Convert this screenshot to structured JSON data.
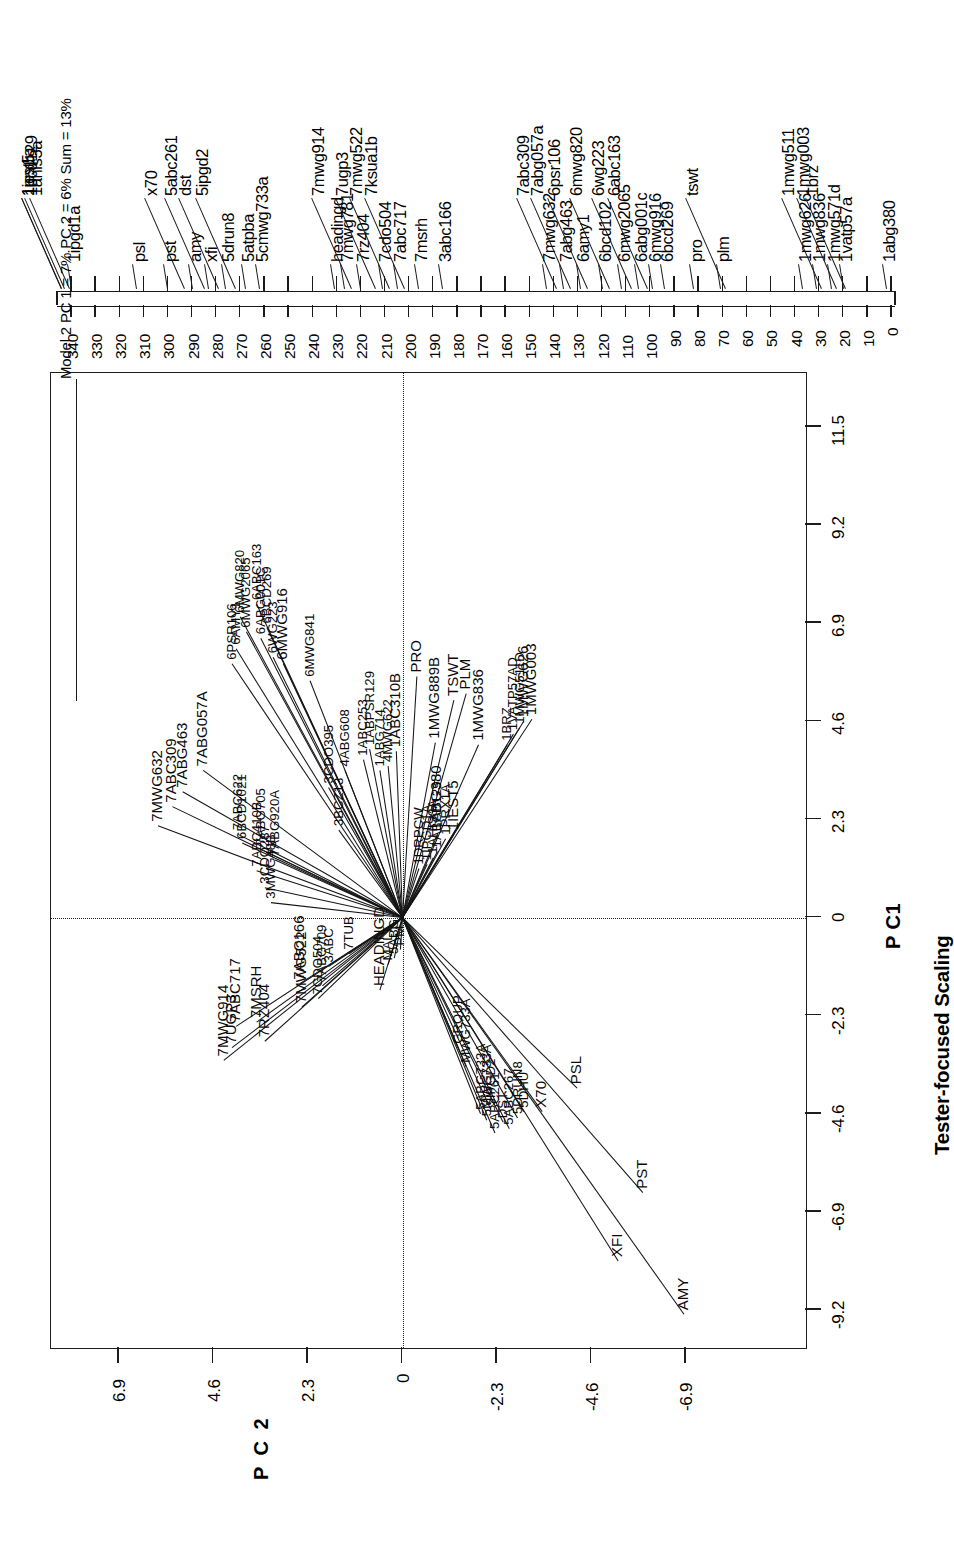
{
  "figure": {
    "domain": "chart",
    "title_box": "Model 2 PC 1 = 7% PC 2 = 6% Sum = 13%",
    "subtitle": "Tester-focused Scaling",
    "pc1_label": "P C1",
    "pc2_label": "P C 2"
  },
  "chart_data": {
    "type": "scatter",
    "title": "Model 2 PC 1 = 7% PC 2 = 6% Sum = 13%",
    "subtitle": "Tester-focused Scaling",
    "xlabel": "P C1",
    "ylabel": "P C 2",
    "xlim": [
      -10.35,
      12.65
    ],
    "ylim": [
      -8.05,
      8.05
    ],
    "xticks": [
      -9.2,
      -6.9,
      -4.6,
      -2.3,
      0,
      2.3,
      4.6,
      6.9,
      9.2,
      11.5
    ],
    "xticklabels": [
      "-9.2",
      "-6.9",
      "-4.6",
      "-2.3",
      "0",
      "2.3",
      "4.6",
      "6.9",
      "9.2",
      "11.5"
    ],
    "yticks": [
      6.9,
      4.6,
      2.3,
      0,
      -2.3,
      -4.6,
      -6.9
    ],
    "yticklabels": [
      "6.9",
      "4.6",
      "2.3",
      "0",
      "-2.3",
      "-4.6",
      "-6.9"
    ],
    "grid": false,
    "legend": "none",
    "origin": [
      0,
      0
    ],
    "reference_lines": [
      {
        "orientation": "vertical",
        "value": 0,
        "style": "dashed"
      },
      {
        "orientation": "horizontal",
        "value": 0,
        "style": "dashed"
      }
    ],
    "vectors": [
      {
        "label": "AMY",
        "x": -9.3,
        "y": -6.85
      },
      {
        "label": "XFI",
        "x": -8.05,
        "y": -5.25
      },
      {
        "label": "PST",
        "x": -6.45,
        "y": -5.85
      },
      {
        "label": "X70",
        "x": -4.55,
        "y": -3.4
      },
      {
        "label": "PSL",
        "x": -4.0,
        "y": -4.25
      },
      {
        "label": "5ABC261",
        "x": -5.05,
        "y": -2.25
      },
      {
        "label": "5ABC267",
        "x": -4.95,
        "y": -2.6
      },
      {
        "label": "DST",
        "x": -4.8,
        "y": -2.45
      },
      {
        "label": "5DRUN8",
        "x": -4.7,
        "y": -2.8
      },
      {
        "label": "5DHU",
        "x": -4.55,
        "y": -2.95
      },
      {
        "label": "5IPGD2",
        "x": -4.5,
        "y": -2.15
      },
      {
        "label": "5MWG733A",
        "x": -4.75,
        "y": -2.05
      },
      {
        "label": "5ABG733A",
        "x": -4.6,
        "y": -1.9
      },
      {
        "label": "MWG733A",
        "x": -3.5,
        "y": -1.55
      },
      {
        "label": "GROUP",
        "x": -3.05,
        "y": -1.35
      },
      {
        "label": "7MWG914",
        "x": -3.35,
        "y": 4.35
      },
      {
        "label": "7UGP3",
        "x": -3.05,
        "y": 4.15
      },
      {
        "label": "7ABC717",
        "x": -2.55,
        "y": 4.05
      },
      {
        "label": "7MSRH",
        "x": -2.45,
        "y": 3.55
      },
      {
        "label": "7RZ404",
        "x": -2.9,
        "y": 3.35
      },
      {
        "label": "7MWG522",
        "x": -2.1,
        "y": 2.45
      },
      {
        "label": "7ABC166",
        "x": -1.55,
        "y": 2.5
      },
      {
        "label": "7CDO504",
        "x": -1.9,
        "y": 2.05
      },
      {
        "label": "7ABG709",
        "x": -1.6,
        "y": 1.95
      },
      {
        "label": "3ABC",
        "x": -1.15,
        "y": 1.8
      },
      {
        "label": "HEADINGD",
        "x": -1.7,
        "y": 0.55
      },
      {
        "label": "7TUB",
        "x": -0.85,
        "y": 1.3
      },
      {
        "label": "MALT",
        "x": -1.1,
        "y": 0.35
      },
      {
        "label": "PM",
        "x": -0.75,
        "y": 0.05
      },
      {
        "label": "5ABG",
        "x": -0.95,
        "y": 0.2
      },
      {
        "label": "7MWG632",
        "x": 2.15,
        "y": 5.95
      },
      {
        "label": "7ABC309",
        "x": 2.6,
        "y": 5.6
      },
      {
        "label": "7ABG463",
        "x": 2.95,
        "y": 5.35
      },
      {
        "label": "7ABG057A",
        "x": 3.45,
        "y": 4.85
      },
      {
        "label": "7ABC622",
        "x": 1.95,
        "y": 4.0
      },
      {
        "label": "7ABG705",
        "x": 1.6,
        "y": 3.45
      },
      {
        "label": "7ABC410B",
        "x": 1.1,
        "y": 3.55
      },
      {
        "label": "7ABG920A",
        "x": 1.35,
        "y": 3.1
      },
      {
        "label": "3CDO287",
        "x": 0.7,
        "y": 3.35
      },
      {
        "label": "3MWG48B",
        "x": 0.35,
        "y": 3.2
      },
      {
        "label": "6PSR106",
        "x": 5.95,
        "y": 4.15
      },
      {
        "label": "6AMY1",
        "x": 6.3,
        "y": 4.05
      },
      {
        "label": "6MWG820",
        "x": 7.05,
        "y": 3.95
      },
      {
        "label": "6MWG2065",
        "x": 6.7,
        "y": 3.8
      },
      {
        "label": "6ABC163",
        "x": 7.35,
        "y": 3.55
      },
      {
        "label": "6ABG001C",
        "x": 6.55,
        "y": 3.45
      },
      {
        "label": "6BCD269",
        "x": 6.8,
        "y": 3.3
      },
      {
        "label": "6MWG916",
        "x": 5.95,
        "y": 2.9
      },
      {
        "label": "6WG223",
        "x": 6.1,
        "y": 3.15
      },
      {
        "label": "6MWG841",
        "x": 5.55,
        "y": 2.25
      },
      {
        "label": "6BCD1021",
        "x": 1.75,
        "y": 3.9
      },
      {
        "label": "3CDO395",
        "x": 3.05,
        "y": 1.8
      },
      {
        "label": "3BCZ13",
        "x": 2.05,
        "y": 1.55
      },
      {
        "label": "4ABG608",
        "x": 3.45,
        "y": 1.4
      },
      {
        "label": "1ABC253",
        "x": 3.7,
        "y": 0.95
      },
      {
        "label": "1ABPSR129",
        "x": 3.95,
        "y": 0.8
      },
      {
        "label": "1ABG714",
        "x": 3.45,
        "y": 0.55
      },
      {
        "label": "4MWG622",
        "x": 3.55,
        "y": 0.35
      },
      {
        "label": "1ABC310B",
        "x": 3.9,
        "y": 0.15
      },
      {
        "label": "1MWG889B",
        "x": 4.1,
        "y": -0.8
      },
      {
        "label": "1MWG836",
        "x": 4.05,
        "y": -1.85
      },
      {
        "label": "1BRZ",
        "x": 4.05,
        "y": -2.55
      },
      {
        "label": "1VATP57AD",
        "x": 4.3,
        "y": -2.7
      },
      {
        "label": "1MWG511D",
        "x": 4.45,
        "y": -2.85
      },
      {
        "label": "1MWG626",
        "x": 4.6,
        "y": -2.95
      },
      {
        "label": "1MWG003",
        "x": 4.65,
        "y": -3.15
      },
      {
        "label": "PRO",
        "x": 5.65,
        "y": -0.35
      },
      {
        "label": "TSWT",
        "x": 5.1,
        "y": -1.25
      },
      {
        "label": "PLM",
        "x": 5.25,
        "y": -1.55
      },
      {
        "label": "1DRPCW",
        "x": 1.15,
        "y": -0.4
      },
      {
        "label": "1IPGD1A",
        "x": 1.25,
        "y": -0.6
      },
      {
        "label": "1AHIS3A",
        "x": 1.4,
        "y": -0.75
      },
      {
        "label": "1ABCD129",
        "x": 1.55,
        "y": -0.85
      },
      {
        "label": "1ABG380",
        "x": 1.95,
        "y": -0.85
      },
      {
        "label": "1PRX1A",
        "x": 1.85,
        "y": -1.05
      },
      {
        "label": "1IEST5",
        "x": 1.95,
        "y": -1.25
      }
    ]
  },
  "map_axis": {
    "range_cM": [
      0,
      340
    ],
    "tick_major_step": 10,
    "tick_labels": [
      "340",
      "330",
      "320",
      "310",
      "300",
      "290",
      "280",
      "270",
      "260",
      "250",
      "240",
      "230",
      "220",
      "210",
      "200",
      "190",
      "180",
      "170",
      "160",
      "150",
      "140",
      "130",
      "120",
      "110",
      "100",
      "90",
      "80",
      "70",
      "60",
      "50",
      "40",
      "30",
      "20",
      "10",
      "0"
    ],
    "markers": [
      {
        "name": "1prx1a",
        "cM": 344,
        "row": 6
      },
      {
        "name": "1iest5",
        "cM": 344,
        "row": 7
      },
      {
        "name": "1bcd129",
        "cM": 343,
        "row": 5
      },
      {
        "name": "1ahis3a",
        "cM": 341,
        "row": 7
      },
      {
        "name": "1ipgd1a",
        "cM": 340,
        "row": 4
      },
      {
        "name": "psl",
        "cM": 313,
        "row": 2
      },
      {
        "name": "pst",
        "cM": 300,
        "row": 2
      },
      {
        "name": "x70",
        "cM": 293,
        "row": 5
      },
      {
        "name": "amy",
        "cM": 290,
        "row": 2
      },
      {
        "name": "5abc261",
        "cM": 285,
        "row": 6
      },
      {
        "name": "xfi",
        "cM": 283,
        "row": 2
      },
      {
        "name": "dst",
        "cM": 279,
        "row": 5
      },
      {
        "name": "5drun8",
        "cM": 276,
        "row": 3
      },
      {
        "name": "5ipgd2",
        "cM": 272,
        "row": 5
      },
      {
        "name": "5atpba",
        "cM": 268,
        "row": 3
      },
      {
        "name": "5cmwg733a",
        "cM": 262,
        "row": 3
      },
      {
        "name": "headingd",
        "cM": 231,
        "row": 2
      },
      {
        "name": "7mwg781",
        "cM": 227,
        "row": 2
      },
      {
        "name": "7mwg914",
        "cM": 224,
        "row": 6
      },
      {
        "name": "7rz404",
        "cM": 220,
        "row": 2
      },
      {
        "name": "7ugp3",
        "cM": 214,
        "row": 6
      },
      {
        "name": "7cdo504",
        "cM": 211,
        "row": 2
      },
      {
        "name": "7mwg522",
        "cM": 208,
        "row": 6
      },
      {
        "name": "7abc717",
        "cM": 205,
        "row": 2
      },
      {
        "name": "7ksua1b",
        "cM": 202,
        "row": 6
      },
      {
        "name": "7msrh",
        "cM": 196,
        "row": 2
      },
      {
        "name": "3abc166",
        "cM": 186,
        "row": 2
      },
      {
        "name": "7mwg632",
        "cM": 143,
        "row": 2
      },
      {
        "name": "7abc309",
        "cM": 139,
        "row": 6
      },
      {
        "name": "7abg463",
        "cM": 136,
        "row": 2
      },
      {
        "name": "7abg057a",
        "cM": 133,
        "row": 6
      },
      {
        "name": "6amy1",
        "cM": 129,
        "row": 2
      },
      {
        "name": "6psr106",
        "cM": 126,
        "row": 6
      },
      {
        "name": "6bcd102",
        "cM": 120,
        "row": 2
      },
      {
        "name": "6mwg820",
        "cM": 117,
        "row": 6
      },
      {
        "name": "6mwg2065",
        "cM": 112,
        "row": 2
      },
      {
        "name": "6wg223",
        "cM": 108,
        "row": 6
      },
      {
        "name": "6abg001c",
        "cM": 105,
        "row": 2
      },
      {
        "name": "6abc163",
        "cM": 101,
        "row": 6
      },
      {
        "name": "6mwg916",
        "cM": 99,
        "row": 2
      },
      {
        "name": "6bcd269",
        "cM": 94,
        "row": 2
      },
      {
        "name": "pro",
        "cM": 82,
        "row": 2
      },
      {
        "name": "plm",
        "cM": 71,
        "row": 2
      },
      {
        "name": "tswt",
        "cM": 69,
        "row": 5
      },
      {
        "name": "1mwg626",
        "cM": 37,
        "row": 2
      },
      {
        "name": "1mwg836",
        "cM": 31,
        "row": 2
      },
      {
        "name": "1mwg511",
        "cM": 29,
        "row": 6
      },
      {
        "name": "1mwg571d",
        "cM": 25,
        "row": 2
      },
      {
        "name": "1mwg003",
        "cM": 23,
        "row": 6
      },
      {
        "name": "1vatp57a",
        "cM": 20,
        "row": 2
      },
      {
        "name": "1brz",
        "cM": 19,
        "row": 6
      },
      {
        "name": "1abg380",
        "cM": 2,
        "row": 1
      }
    ]
  }
}
